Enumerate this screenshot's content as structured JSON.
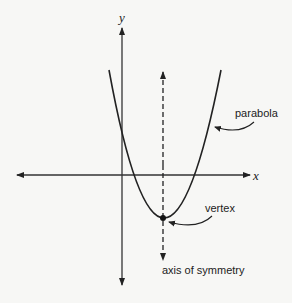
{
  "diagram": {
    "axes": {
      "x_label": "x",
      "y_label": "y"
    },
    "labels": {
      "parabola": "parabola",
      "vertex": "vertex",
      "axis_of_symmetry": "axis of symmetry"
    },
    "colors": {
      "background": "#f7f7f5",
      "ink": "#222222",
      "axis": "#333333"
    }
  }
}
